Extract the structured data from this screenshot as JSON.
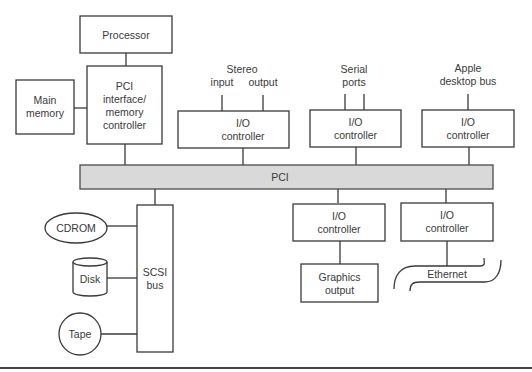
{
  "diagram": {
    "processor": {
      "label": "Processor"
    },
    "pci_interface": {
      "lines": [
        "PCI",
        "interface/",
        "memory",
        "controller"
      ]
    },
    "main_memory": {
      "lines": [
        "Main",
        "memory"
      ]
    },
    "pci_bus": {
      "label": "PCI",
      "fill": "#d9d9d9"
    },
    "io_stereo": {
      "group_label": "Stereo",
      "port_labels": [
        "input",
        "output"
      ],
      "lines": [
        "I/O",
        "controller"
      ]
    },
    "io_serial": {
      "group_lines": [
        "Serial",
        "ports"
      ],
      "lines": [
        "I/O",
        "controller"
      ]
    },
    "io_adb": {
      "group_lines": [
        "Apple",
        "desktop bus"
      ],
      "lines": [
        "I/O",
        "controller"
      ]
    },
    "io_graphics": {
      "lines": [
        "I/O",
        "controller"
      ]
    },
    "graphics_output": {
      "lines": [
        "Graphics",
        "output"
      ]
    },
    "io_ethernet": {
      "lines": [
        "I/O",
        "controller"
      ]
    },
    "ethernet": {
      "label": "Ethernet"
    },
    "scsi_bus": {
      "lines": [
        "SCSI",
        "bus"
      ]
    },
    "cdrom": {
      "label": "CDROM"
    },
    "disk": {
      "label": "Disk"
    },
    "tape": {
      "label": "Tape"
    }
  }
}
